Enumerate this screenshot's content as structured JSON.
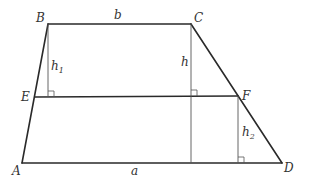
{
  "diagram": {
    "type": "trapezoid-with-heights",
    "colors": {
      "line": "#2a2a2a",
      "thin": "#555555",
      "text": "#333333",
      "background": "#ffffff"
    },
    "points": {
      "A": {
        "label": "A",
        "x": 22,
        "y": 163
      },
      "B": {
        "label": "B",
        "x": 48,
        "y": 24
      },
      "C": {
        "label": "C",
        "x": 191,
        "y": 24
      },
      "D": {
        "label": "D",
        "x": 282,
        "y": 163
      },
      "E": {
        "label": "E",
        "x": 35,
        "y": 97
      },
      "F": {
        "label": "F",
        "x": 238,
        "y": 96
      }
    },
    "sides": {
      "a": {
        "label": "a",
        "segment": "AD"
      },
      "b": {
        "label": "b",
        "segment": "BC"
      }
    },
    "heights": {
      "h": {
        "label": "h",
        "main": "h",
        "sub": ""
      },
      "h1": {
        "label": "h1",
        "main": "h",
        "sub": "1"
      },
      "h2": {
        "label": "h2",
        "main": "h",
        "sub": "2"
      }
    }
  }
}
